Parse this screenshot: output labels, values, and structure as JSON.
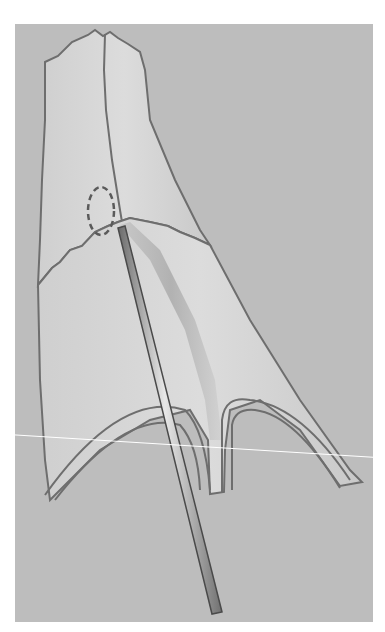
{
  "figure": {
    "colors": {
      "page_background": "#ffffff",
      "panel_background": "#bdbdbd",
      "tissue_fill": "#d6d6d6",
      "outline": "#6e6e6e",
      "probe_fill": "#9a9a9a",
      "scan_line": "#ffffff"
    }
  }
}
